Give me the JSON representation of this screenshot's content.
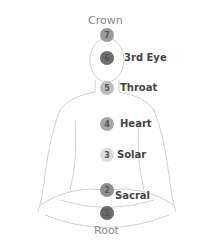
{
  "title_top": "Crown",
  "title_bottom": "Root",
  "chakras": [
    {
      "number": "7",
      "label": "",
      "color": "#9a9a9a"
    },
    {
      "number": "6",
      "label": "3rd Eye",
      "color": "#6e6e6e"
    },
    {
      "number": "5",
      "label": "Throat",
      "color": "#bdbdbd"
    },
    {
      "number": "4",
      "label": "Heart",
      "color": "#a8a8a8"
    },
    {
      "number": "3",
      "label": "Solar",
      "color": "#dcdcdc"
    },
    {
      "number": "2",
      "label": "Sacral",
      "color": "#8f8f8f"
    },
    {
      "number": "1",
      "label": "",
      "color": "#6a6a6a"
    }
  ]
}
